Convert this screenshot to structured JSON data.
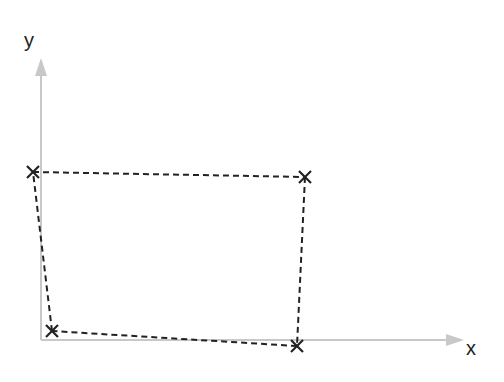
{
  "diagram": {
    "type": "quadrilateral-on-axes",
    "axes": {
      "x_label": "x",
      "y_label": "y",
      "color": "#c8c8c8",
      "origin": [
        41,
        340
      ],
      "x_end": [
        464,
        340
      ],
      "y_end": [
        41,
        58
      ]
    },
    "points": [
      {
        "name": "top-left",
        "x": 33,
        "y": 172
      },
      {
        "name": "top-right",
        "x": 305,
        "y": 177
      },
      {
        "name": "bottom-right",
        "x": 297,
        "y": 346
      },
      {
        "name": "bottom-left",
        "x": 52,
        "y": 331
      }
    ],
    "edges": [
      [
        0,
        1
      ],
      [
        1,
        2
      ],
      [
        2,
        3
      ],
      [
        3,
        0
      ]
    ],
    "style": {
      "edge_color": "#222222",
      "edge_dash": "6,4",
      "marker": "x",
      "marker_color": "#222222"
    }
  }
}
